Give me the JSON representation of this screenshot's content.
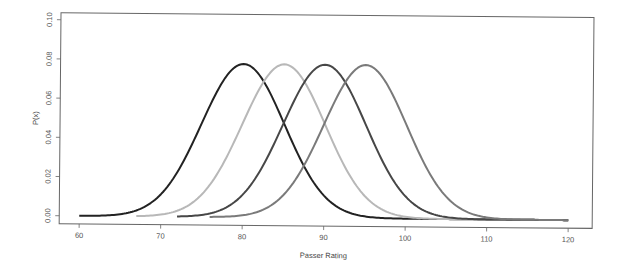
{
  "chart_data": {
    "type": "line",
    "title": "",
    "xlabel": "Passer Rating",
    "ylabel": "P(x)",
    "xlim": [
      60,
      120
    ],
    "ylim": [
      0,
      0.1
    ],
    "x_ticks": [
      60,
      70,
      80,
      90,
      100,
      110,
      120
    ],
    "x_tick_labels": [
      "60",
      "70",
      "80",
      "90",
      "100",
      "110",
      "120"
    ],
    "y_ticks": [
      0.0,
      0.02,
      0.04,
      0.06,
      0.08,
      0.1
    ],
    "y_tick_labels": [
      "0.00",
      "0.02",
      "0.04",
      "0.06",
      "0.08",
      "0.10"
    ],
    "grid": false,
    "legend": null,
    "series": [
      {
        "name": "mean 80",
        "distribution": "normal",
        "mean": 80,
        "sd": 5.1,
        "x_range": [
          60,
          120
        ],
        "peak": 0.078,
        "color": "#222222"
      },
      {
        "name": "mean 85",
        "distribution": "normal",
        "mean": 85,
        "sd": 5.1,
        "x_range": [
          67,
          120
        ],
        "peak": 0.078,
        "color": "#b8b8b8"
      },
      {
        "name": "mean 90",
        "distribution": "normal",
        "mean": 90,
        "sd": 5.1,
        "x_range": [
          72,
          120
        ],
        "peak": 0.078,
        "color": "#474747"
      },
      {
        "name": "mean 95",
        "distribution": "normal",
        "mean": 95,
        "sd": 5.1,
        "x_range": [
          76,
          120
        ],
        "peak": 0.078,
        "color": "#7a7a7a"
      }
    ]
  }
}
